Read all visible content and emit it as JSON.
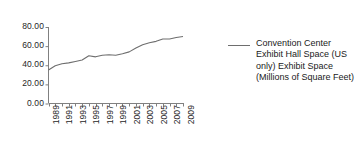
{
  "chart_data": {
    "type": "line",
    "title": "",
    "xlabel": "",
    "ylabel": "",
    "grid": false,
    "legend_position": "right",
    "ylim": [
      0,
      80
    ],
    "ytick_labels": [
      "80.00",
      "60.00",
      "40.00",
      "20.00",
      "0.00"
    ],
    "ytick_values": [
      80,
      60,
      40,
      20,
      0
    ],
    "xtick_labels": [
      "1989",
      "1991",
      "1993",
      "1995",
      "1997",
      "1999",
      "2001",
      "2003",
      "2005",
      "2007",
      "2009"
    ],
    "x": [
      1989,
      1990,
      1991,
      1992,
      1993,
      1994,
      1995,
      1996,
      1997,
      1998,
      1999,
      2000,
      2001,
      2002,
      2003,
      2004,
      2005,
      2006,
      2007,
      2008,
      2009
    ],
    "series": [
      {
        "name": "Convention Center Exhibit Hall Space (US only) Exhibit Space (Millions of Square Feet)",
        "color": "#6e6e6e",
        "values": [
          35.0,
          39.5,
          41.5,
          42.5,
          44.0,
          45.5,
          50.0,
          48.8,
          50.5,
          51.0,
          50.5,
          52.0,
          54.0,
          58.0,
          61.5,
          63.5,
          65.0,
          67.5,
          67.5,
          69.0,
          70.0
        ]
      }
    ],
    "legend": [
      {
        "marker": "line-swatch",
        "label": "Convention Center Exhibit Hall Space (US only) Exhibit Space (Millions of Square Feet)"
      }
    ]
  },
  "axis": {
    "line_color": "#808080"
  }
}
